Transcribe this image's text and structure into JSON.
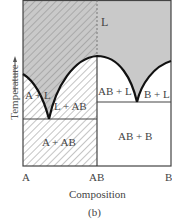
{
  "diagram": {
    "type": "binary phase diagram with intermediate compound",
    "caption": "(b)",
    "x_axis": {
      "label": "Composition",
      "ticks": [
        "A",
        "AB",
        "B"
      ]
    },
    "y_axis": {
      "label": "Temperature"
    },
    "regions": [
      {
        "id": "liquid",
        "label": "L"
      },
      {
        "id": "a-plus-l",
        "label": "A + L"
      },
      {
        "id": "l-plus-ab",
        "label": "L + AB"
      },
      {
        "id": "ab-plus-l",
        "label": "AB + L"
      },
      {
        "id": "b-plus-l",
        "label": "B + L"
      },
      {
        "id": "a-plus-ab",
        "label": "A + AB"
      },
      {
        "id": "ab-plus-b",
        "label": "AB + B"
      }
    ],
    "colors": {
      "liquid_fill": "#c8c8c8",
      "hatch": "#888888",
      "line": "#111111",
      "frame": "#444444"
    }
  }
}
